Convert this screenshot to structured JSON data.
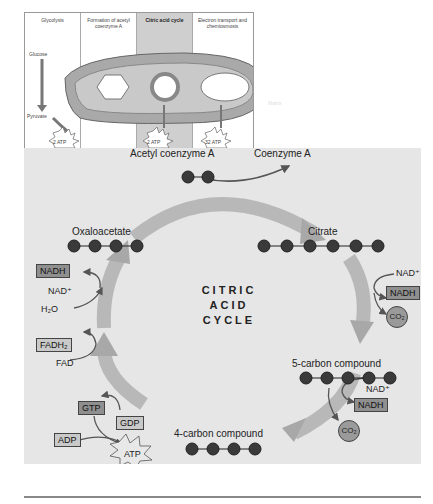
{
  "overview": {
    "stages": [
      {
        "label": "Glycolysis",
        "highlight": false
      },
      {
        "label": "Formation of acetyl coenzyme A",
        "highlight": false
      },
      {
        "label": "Citric acid cycle",
        "highlight": true
      },
      {
        "label": "Electron transport and chemiosmosis",
        "highlight": false
      }
    ],
    "glucose_label": "Glucose",
    "pyruvate_label": "Pyruvate",
    "atp_yields": [
      "2 ATP",
      "2 ATP",
      "32 ATP"
    ],
    "faint_label": "Matrix"
  },
  "cycle": {
    "title_lines": [
      "CITRIC",
      "ACID",
      "CYCLE"
    ],
    "input_label": "Acetyl coenzyme A",
    "output_label": "Coenzyme A",
    "compounds": [
      {
        "name": "Oxaloacetate",
        "carbons": 4
      },
      {
        "name": "Citrate",
        "carbons": 6
      },
      {
        "name": "5-carbon compound",
        "carbons": 5
      },
      {
        "name": "4-carbon compound",
        "carbons": 4
      }
    ],
    "acetyl_carbons": 2,
    "step1": {
      "nad_in": "NAD⁺",
      "nadh_out": "NADH",
      "co2": "CO₂"
    },
    "step2": {
      "nad_in": "NAD⁺",
      "nadh_out": "NADH",
      "co2": "CO₂"
    },
    "step3": {
      "gtp": "GTP",
      "gdp": "GDP",
      "adp": "ADP",
      "atp": "ATP"
    },
    "step4": {
      "fad_in": "FAD",
      "fadh2_out": "FADH₂"
    },
    "step5": {
      "h2o": "H₂O",
      "nad_in": "NAD⁺",
      "nadh_out": "NADH"
    }
  },
  "colors": {
    "panel_bg": "#e6e6e6",
    "arrow_fill": "#b8b8b8",
    "carbon": "#3a3a3a",
    "box_dark": "#8f8f8f",
    "box_light": "#c9c9c9",
    "highlight_col": "#cfcfcf"
  }
}
